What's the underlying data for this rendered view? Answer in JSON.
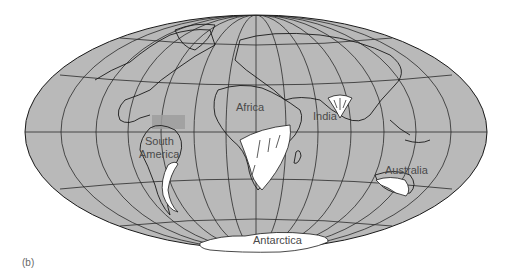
{
  "figure": {
    "panel_label": "(b)",
    "projection": "Mollweide-style world map",
    "colors": {
      "ocean_land": "#b9b9b9",
      "glaciated": "#ffffff",
      "outline": "#1a1a1a",
      "highlight_box": "#9e9e9e",
      "background": "#ffffff"
    }
  },
  "labels": {
    "africa": "Africa",
    "india": "India",
    "south_america_line1": "South",
    "south_america_line2": "America",
    "australia": "Australia",
    "antarctica": "Antarctica"
  }
}
